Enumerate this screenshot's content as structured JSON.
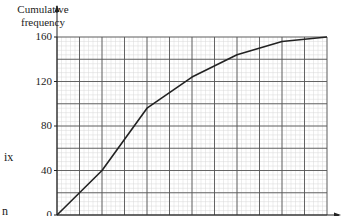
{
  "chart_data": {
    "type": "line",
    "title": "",
    "xlabel": "",
    "ylabel": "Cumulative frequency",
    "ylabel_lines": [
      "Cumulative",
      "frequency"
    ],
    "y_ticks": [
      0,
      40,
      80,
      120,
      160
    ],
    "ylim": [
      0,
      160
    ],
    "x_grid_columns": 12,
    "grid": true,
    "series": [
      {
        "name": "Cumulative frequency",
        "x": [
          0,
          2,
          4,
          6,
          8,
          10,
          12
        ],
        "values": [
          0,
          40,
          96,
          124,
          144,
          156,
          160
        ]
      }
    ]
  },
  "fragments": {
    "left_text_1": "ix",
    "left_text_2": "n"
  },
  "colors": {
    "line": "#222222",
    "major_grid": "#555555",
    "minor_grid": "#d8d8d8"
  }
}
